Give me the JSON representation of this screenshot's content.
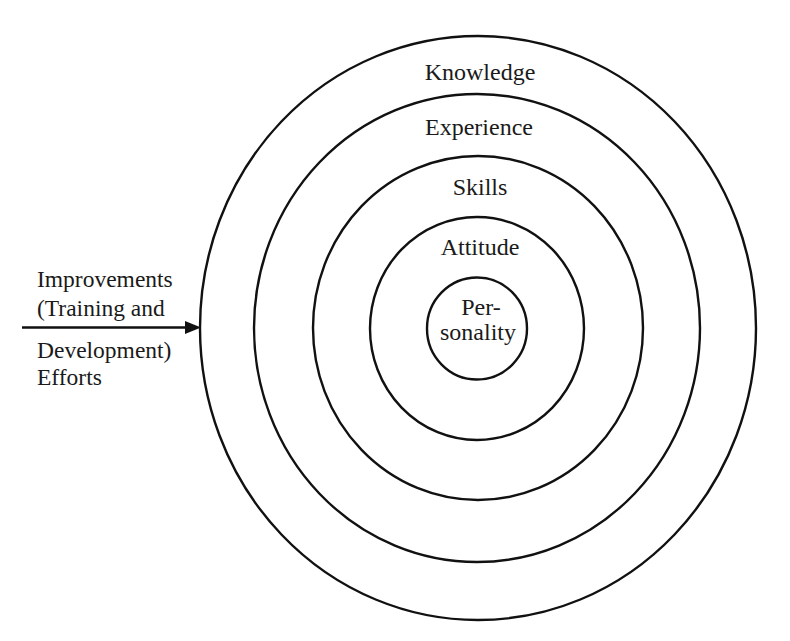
{
  "diagram": {
    "type": "concentric-circles",
    "rings": [
      {
        "id": "knowledge",
        "label": "Knowledge"
      },
      {
        "id": "experience",
        "label": "Experience"
      },
      {
        "id": "skills",
        "label": "Skills"
      },
      {
        "id": "attitude",
        "label": "Attitude"
      },
      {
        "id": "personality",
        "label_line1": "Per-",
        "label_line2": "sonality"
      }
    ],
    "input_arrow": {
      "direction": "points-into-outer-ring",
      "label_lines": [
        "Improvements",
        "(Training and",
        "Development)",
        "Efforts"
      ]
    },
    "colors": {
      "stroke": "#111111",
      "text": "#1a1a1a",
      "background": "#ffffff"
    }
  }
}
